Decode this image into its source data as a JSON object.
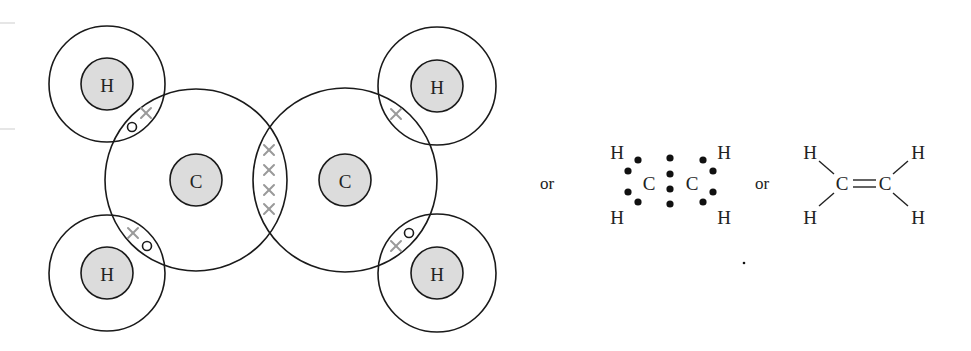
{
  "diagram": {
    "colors": {
      "nucleus_fill": "#dcdcdc",
      "outline": "#1a1a1a",
      "shared_cross": "#9a9a9a"
    },
    "orbital_model": {
      "carbon_labels": [
        "C",
        "C"
      ],
      "hydrogen_labels": [
        "H",
        "H",
        "H",
        "H"
      ],
      "electron_symbols": {
        "carbon": "×",
        "hydrogen": "○"
      },
      "double_bond_electrons": 4
    },
    "separator_1": "or",
    "lewis_structure": {
      "atoms": {
        "h_top_left": "H",
        "h_bottom_left": "H",
        "c_left": "C",
        "c_right": "C",
        "h_top_right": "H",
        "h_bottom_right": "H"
      },
      "dot_count": 12
    },
    "separator_2": "or",
    "structural_formula": {
      "atoms": {
        "h_top_left": "H",
        "h_bottom_left": "H",
        "c_left": "C",
        "c_right": "C",
        "h_top_right": "H",
        "h_bottom_right": "H"
      },
      "bond_symbol": "="
    }
  }
}
